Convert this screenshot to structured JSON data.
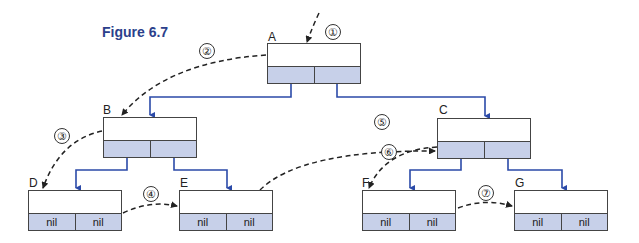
{
  "figure": {
    "title": "Figure 6.7",
    "colors": {
      "pointer_line": "#2b4aa8",
      "pointer_dot": "#1e2f8a",
      "link_field_fill": "#c7d0e9",
      "traversal_dashed": "#222222",
      "title": "#2b3f8c"
    }
  },
  "nodes": [
    {
      "id": "A",
      "label": "A",
      "left": "•",
      "right": "•"
    },
    {
      "id": "B",
      "label": "B",
      "left": "•",
      "right": "•"
    },
    {
      "id": "C",
      "label": "C",
      "left": "•",
      "right": "•"
    },
    {
      "id": "D",
      "label": "D",
      "left": "nil",
      "right": "nil"
    },
    {
      "id": "E",
      "label": "E",
      "left": "nil",
      "right": "nil"
    },
    {
      "id": "F",
      "label": "F",
      "left": "nil",
      "right": "nil"
    },
    {
      "id": "G",
      "label": "G",
      "left": "nil",
      "right": "nil"
    }
  ],
  "steps": [
    "①",
    "②",
    "③",
    "④",
    "⑤",
    "⑥",
    "⑦"
  ],
  "edges": [
    {
      "from": "A",
      "to": "B",
      "side": "left"
    },
    {
      "from": "A",
      "to": "C",
      "side": "right"
    },
    {
      "from": "B",
      "to": "D",
      "side": "left"
    },
    {
      "from": "B",
      "to": "E",
      "side": "right"
    },
    {
      "from": "C",
      "to": "F",
      "side": "left"
    },
    {
      "from": "C",
      "to": "G",
      "side": "right"
    }
  ],
  "traversal": [
    {
      "step": "①",
      "to": "A"
    },
    {
      "step": "②",
      "from": "A",
      "to": "B"
    },
    {
      "step": "③",
      "from": "B",
      "to": "D"
    },
    {
      "step": "④",
      "from": "D",
      "to": "E"
    },
    {
      "step": "⑤",
      "from": "E",
      "to": "C"
    },
    {
      "step": "⑥",
      "from": "C",
      "to": "F"
    },
    {
      "step": "⑦",
      "from": "F",
      "to": "G"
    }
  ]
}
